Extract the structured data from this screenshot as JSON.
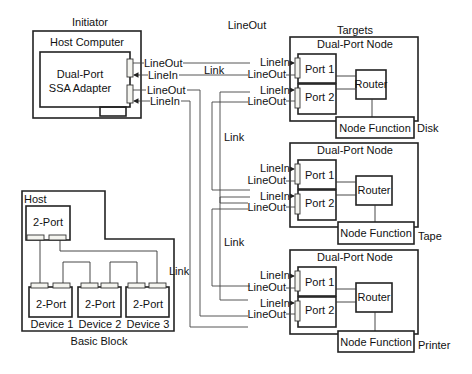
{
  "diagram": {
    "type": "SSA serial storage architecture topology",
    "labels": {
      "initiator": "Initiator",
      "targets": "Targets",
      "top_lineout": "LineOut",
      "host_computer": "Host Computer",
      "adapter_line1": "Dual-Port",
      "adapter_line2": "SSA Adapter",
      "link": "Link"
    },
    "initiator_ports": [
      {
        "label": "LineOut"
      },
      {
        "label": "LineIn"
      },
      {
        "label": "LineOut"
      },
      {
        "label": "LineIn"
      }
    ],
    "nodes": [
      {
        "title": "Dual-Port Node",
        "port1": "Port 1",
        "port2": "Port 2",
        "router": "Router",
        "function": "Node Function",
        "device": "Disk",
        "lines": [
          "LineIn",
          "LineOut",
          "LineIn",
          "LineOut"
        ]
      },
      {
        "title": "Dual-Port Node",
        "port1": "Port 1",
        "port2": "Port 2",
        "router": "Router",
        "function": "Node Function",
        "device": "Tape",
        "lines": [
          "LineIn",
          "LineOut",
          "LineIn",
          "LineOut"
        ]
      },
      {
        "title": "Dual-Port Node",
        "port1": "Port 1",
        "port2": "Port 2",
        "router": "Router",
        "function": "Node Function",
        "device": "Printer",
        "lines": [
          "LineIn",
          "LineOut",
          "LineIn",
          "LineOut"
        ]
      }
    ],
    "link_labels": [
      "Link",
      "Link",
      "Link",
      "Link"
    ],
    "basic_block": {
      "title": "Basic Block",
      "host_label": "Host",
      "host_port": "2-Port",
      "devices": [
        {
          "port": "2-Port",
          "name": "Device 1"
        },
        {
          "port": "2-Port",
          "name": "Device 2"
        },
        {
          "port": "2-Port",
          "name": "Device 3"
        }
      ]
    }
  }
}
